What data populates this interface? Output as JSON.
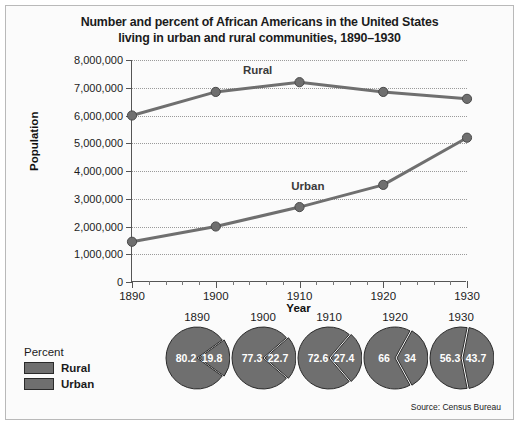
{
  "figure": {
    "title_line1": "Number and percent of African Americans in the United States",
    "title_line2": "living in urban and rural communities, 1890–1930",
    "source": "Source: Census Bureau"
  },
  "legend": {
    "title": "Percent",
    "items": [
      {
        "label": "Rural",
        "color": "#6f6f6f"
      },
      {
        "label": "Urban",
        "color": "#6f6f6f"
      }
    ]
  },
  "chart_data": {
    "type": "line",
    "title": "Number and percent of African Americans in the United States living in urban and rural communities, 1890–1930",
    "xlabel": "Year",
    "ylabel": "Population",
    "x": [
      1890,
      1900,
      1910,
      1920,
      1930
    ],
    "xtick_labels": [
      "1890",
      "1900",
      "1910",
      "1920",
      "1930"
    ],
    "ytick_labels": [
      "0",
      "1,000,000",
      "2,000,000",
      "3,000,000",
      "4,000,000",
      "5,000,000",
      "6,000,000",
      "7,000,000",
      "8,000,000"
    ],
    "ytick_values": [
      0,
      1000000,
      2000000,
      3000000,
      4000000,
      5000000,
      6000000,
      7000000,
      8000000
    ],
    "ylim": [
      0,
      8000000
    ],
    "xlim": [
      1890,
      1930
    ],
    "grid": true,
    "legend_position": "inline-labels",
    "series": [
      {
        "name": "Rural",
        "color": "#6f6f6f",
        "values": [
          6000000,
          6850000,
          7200000,
          6850000,
          6600000
        ],
        "label_x": 1905,
        "label_y": 7650000
      },
      {
        "name": "Urban",
        "color": "#6f6f6f",
        "values": [
          1450000,
          2000000,
          2700000,
          3500000,
          5200000
        ],
        "label_x": 1911,
        "label_y": 3450000
      }
    ]
  },
  "pies": {
    "type": "pie",
    "title": "Percent",
    "charts": [
      {
        "year": "1890",
        "rural": "80.2",
        "urban": "19.8",
        "rural_value": 80.2,
        "urban_value": 19.8
      },
      {
        "year": "1900",
        "rural": "77.3",
        "urban": "22.7",
        "rural_value": 77.3,
        "urban_value": 22.7
      },
      {
        "year": "1910",
        "rural": "72.6",
        "urban": "27.4",
        "rural_value": 72.6,
        "urban_value": 27.4
      },
      {
        "year": "1920",
        "rural": "66",
        "urban": "34",
        "rural_value": 66.0,
        "urban_value": 34.0
      },
      {
        "year": "1930",
        "rural": "56.3",
        "urban": "43.7",
        "rural_value": 56.3,
        "urban_value": 43.7
      }
    ]
  }
}
